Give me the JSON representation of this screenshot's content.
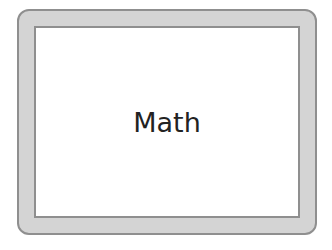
{
  "card": {
    "label": "Math"
  }
}
